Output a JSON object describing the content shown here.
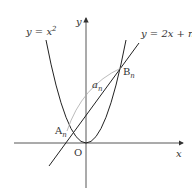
{
  "diagram": {
    "labels": {
      "y_axis": "y",
      "x_axis": "x",
      "origin": "O",
      "parabola": "y = x²",
      "parabola_lhs": "y = x",
      "parabola_exp": "2",
      "line": "y = 2x + n",
      "point_a": "A",
      "point_a_sub": "n",
      "point_b": "B",
      "point_b_sub": "n",
      "arc": "a",
      "arc_sub": "n"
    },
    "colors": {
      "axis": "#333333",
      "curve": "#222222",
      "arc": "#aaaaaa",
      "text": "#333333"
    }
  }
}
